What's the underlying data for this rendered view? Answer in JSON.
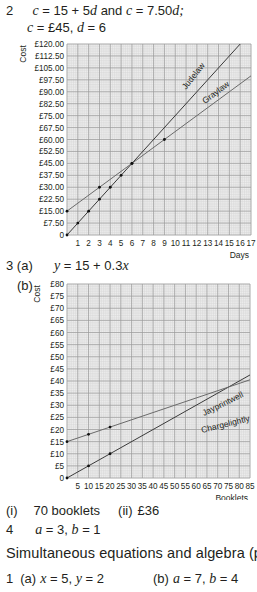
{
  "q2": {
    "number": "2",
    "line1_a": "c",
    "line1_b": " = 15 + 5",
    "line1_c": "d",
    "line1_d": " and ",
    "line1_e": "c",
    "line1_f": " = 7.50",
    "line1_g": "d;",
    "line2_a": "c",
    "line2_b": " = £45, ",
    "line2_c": "d",
    "line2_d": " = 6"
  },
  "q3": {
    "number": "3 (a)",
    "a_eq_y": "y",
    "a_eq_rest": " = 15 + 0.3",
    "a_eq_x": "x",
    "b_label": "(b)",
    "answers_i": "(i)",
    "answers_i_val": "70 booklets",
    "answers_ii": "(ii)",
    "answers_ii_val": "£36"
  },
  "q4": {
    "number": "4",
    "a": "a",
    "a_val": " = 3, ",
    "b": "b",
    "b_val": " = 1"
  },
  "section": {
    "title": "Simultaneous equations and algebra (p 29)"
  },
  "s1": {
    "number": "1",
    "a_label": "(a)",
    "a_x": "x",
    "a_x_val": " = 5, ",
    "a_y": "y",
    "a_y_val": " = 2",
    "b_label": "(b)",
    "b_a": "a",
    "b_a_val": " = 7, ",
    "b_b": "b",
    "b_b_val": " = 4"
  },
  "chart_data": [
    {
      "type": "line",
      "title": "",
      "xlabel": "Days",
      "ylabel": "Cost",
      "xlim": [
        0,
        17
      ],
      "ylim": [
        0,
        120
      ],
      "grid": true,
      "x_ticks": [
        "1",
        "2",
        "3",
        "4",
        "5",
        "6",
        "7",
        "8",
        "9",
        "10",
        "11",
        "12",
        "13",
        "14",
        "15",
        "16",
        "17"
      ],
      "y_ticks": [
        "0",
        "£7.50",
        "£15.00",
        "£22.50",
        "£30.00",
        "£37.50",
        "£45.00",
        "£52.50",
        "£60.00",
        "£67.50",
        "£75.00",
        "£82.50",
        "£90.00",
        "£97.50",
        "£105.00",
        "£112.50",
        "£120.00"
      ],
      "series": [
        {
          "name": "Judelaw",
          "equation": "c = 7.50d",
          "x": [
            0,
            1,
            2,
            3,
            4,
            5,
            6,
            16
          ],
          "y": [
            0,
            7.5,
            15,
            22.5,
            30,
            37.5,
            45,
            120
          ]
        },
        {
          "name": "Graylaw",
          "equation": "c = 15 + 5d",
          "x": [
            0,
            3,
            6,
            9,
            17
          ],
          "y": [
            15,
            30,
            45,
            60,
            100
          ]
        }
      ]
    },
    {
      "type": "line",
      "title": "",
      "xlabel": "Booklets",
      "ylabel": "Cost",
      "xlim": [
        0,
        85
      ],
      "ylim": [
        0,
        80
      ],
      "grid": true,
      "x_ticks": [
        "5",
        "10",
        "15",
        "20",
        "25",
        "30",
        "35",
        "40",
        "45",
        "50",
        "55",
        "60",
        "65",
        "70",
        "75",
        "80",
        "85"
      ],
      "y_ticks": [
        "0",
        "£5",
        "£10",
        "£15",
        "£20",
        "£25",
        "£30",
        "£35",
        "£40",
        "£45",
        "£50",
        "£55",
        "£60",
        "£65",
        "£70",
        "£75",
        "£80"
      ],
      "series": [
        {
          "name": "Jayprintwell",
          "x": [
            0,
            10,
            20,
            85
          ],
          "y": [
            0,
            5,
            10,
            42.5
          ]
        },
        {
          "name": "Chargelightly",
          "x": [
            0,
            10,
            20,
            85
          ],
          "y": [
            15,
            18,
            21,
            40.5
          ]
        }
      ]
    }
  ]
}
